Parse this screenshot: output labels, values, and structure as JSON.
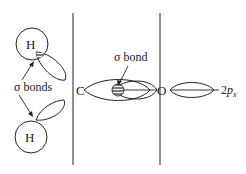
{
  "diagram": {
    "title": "",
    "atoms": {
      "h_top": "H",
      "h_bottom": "H",
      "carbon": "C",
      "oxygen": "O"
    },
    "labels": {
      "sigma_bonds_left": "σ bonds",
      "sigma_bond_center": "σ bond",
      "orbital_2px_main": "2",
      "orbital_2px_sub": "x",
      "orbital_2px_p": "p"
    },
    "colors": {
      "line": "#222222",
      "background": "#ffffff"
    }
  }
}
